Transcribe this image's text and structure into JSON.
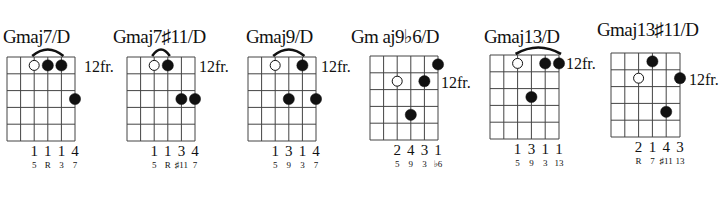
{
  "chord_sheet": {
    "chords": [
      {
        "name": "Gmaj7/D",
        "position_label": "12fr.",
        "grid": {
          "x": 7,
          "y": 57,
          "w": 68,
          "h": 84
        },
        "title_pos": {
          "x": 3,
          "y": 27
        },
        "label_pos": {
          "x": 84,
          "y": 59
        },
        "label_row": 0,
        "barre": {
          "from": 3,
          "to": 5
        },
        "dots": [
          {
            "string": 3,
            "fret": 1,
            "open": true
          },
          {
            "string": 4,
            "fret": 1,
            "open": false
          },
          {
            "string": 5,
            "fret": 1,
            "open": false
          },
          {
            "string": 6,
            "fret": 3,
            "open": false
          }
        ],
        "fingers": [
          "",
          "",
          "1",
          "1",
          "1",
          "4"
        ],
        "intervals": [
          "",
          "",
          "5",
          "R",
          "3",
          "7"
        ]
      },
      {
        "name": "Gmaj7♯11/D",
        "position_label": "12fr.",
        "grid": {
          "x": 127,
          "y": 57,
          "w": 68,
          "h": 84
        },
        "title_pos": {
          "x": 113,
          "y": 27
        },
        "label_pos": {
          "x": 199,
          "y": 59
        },
        "barre": {
          "from": 3,
          "to": 4
        },
        "dots": [
          {
            "string": 3,
            "fret": 1,
            "open": true
          },
          {
            "string": 4,
            "fret": 1,
            "open": false
          },
          {
            "string": 5,
            "fret": 3,
            "open": false
          },
          {
            "string": 6,
            "fret": 3,
            "open": false
          }
        ],
        "fingers": [
          "",
          "",
          "1",
          "1",
          "3",
          "4"
        ],
        "intervals": [
          "",
          "",
          "5",
          "R",
          "♯11",
          "7"
        ]
      },
      {
        "name": "Gmaj9/D",
        "position_label": "12fr.",
        "grid": {
          "x": 248,
          "y": 57,
          "w": 68,
          "h": 84
        },
        "title_pos": {
          "x": 246,
          "y": 27
        },
        "label_pos": {
          "x": 321,
          "y": 59
        },
        "barre": {
          "from": 3,
          "to": 5
        },
        "dots": [
          {
            "string": 3,
            "fret": 1,
            "open": true
          },
          {
            "string": 4,
            "fret": 3,
            "open": false
          },
          {
            "string": 5,
            "fret": 1,
            "open": false
          },
          {
            "string": 6,
            "fret": 3,
            "open": false
          }
        ],
        "fingers": [
          "",
          "",
          "1",
          "3",
          "1",
          "4"
        ],
        "intervals": [
          "",
          "",
          "5",
          "9",
          "3",
          "7"
        ]
      },
      {
        "name": "Gm aj9♭6/D",
        "position_label": "12fr.",
        "grid": {
          "x": 370,
          "y": 56,
          "w": 68,
          "h": 84
        },
        "title_pos": {
          "x": 351,
          "y": 27
        },
        "label_pos": {
          "x": 441,
          "y": 75
        },
        "barre": null,
        "dots": [
          {
            "string": 6,
            "fret": 1,
            "open": false
          },
          {
            "string": 3,
            "fret": 2,
            "open": true
          },
          {
            "string": 5,
            "fret": 2,
            "open": false
          },
          {
            "string": 4,
            "fret": 4,
            "open": false
          }
        ],
        "fingers": [
          "",
          "",
          "2",
          "4",
          "3",
          "1"
        ],
        "intervals": [
          "",
          "",
          "5",
          "9",
          "3",
          "♭6"
        ]
      },
      {
        "name": "Gmaj13/D",
        "position_label": "12fr.",
        "grid": {
          "x": 490,
          "y": 55,
          "w": 69,
          "h": 84
        },
        "title_pos": {
          "x": 484,
          "y": 27
        },
        "label_pos": {
          "x": 566,
          "y": 56
        },
        "barre": {
          "from": 3,
          "to": 6
        },
        "dots": [
          {
            "string": 3,
            "fret": 1,
            "open": true
          },
          {
            "string": 5,
            "fret": 1,
            "open": false
          },
          {
            "string": 6,
            "fret": 1,
            "open": false
          },
          {
            "string": 4,
            "fret": 3,
            "open": false
          }
        ],
        "fingers": [
          "",
          "",
          "1",
          "3",
          "1",
          "1"
        ],
        "intervals": [
          "",
          "",
          "5",
          "9",
          "3",
          "13"
        ]
      },
      {
        "name": "Gmaj13♯11/D",
        "position_label": "12fr.",
        "grid": {
          "x": 611,
          "y": 53,
          "w": 69,
          "h": 84
        },
        "title_pos": {
          "x": 597,
          "y": 20
        },
        "label_pos": {
          "x": 689,
          "y": 72
        },
        "barre": null,
        "dots": [
          {
            "string": 4,
            "fret": 1,
            "open": false
          },
          {
            "string": 3,
            "fret": 2,
            "open": true
          },
          {
            "string": 6,
            "fret": 2,
            "open": false
          },
          {
            "string": 5,
            "fret": 4,
            "open": false
          }
        ],
        "fingers": [
          "",
          "",
          "2",
          "1",
          "4",
          "3"
        ],
        "intervals": [
          "",
          "",
          "R",
          "7",
          "♯11",
          "13"
        ]
      }
    ]
  }
}
